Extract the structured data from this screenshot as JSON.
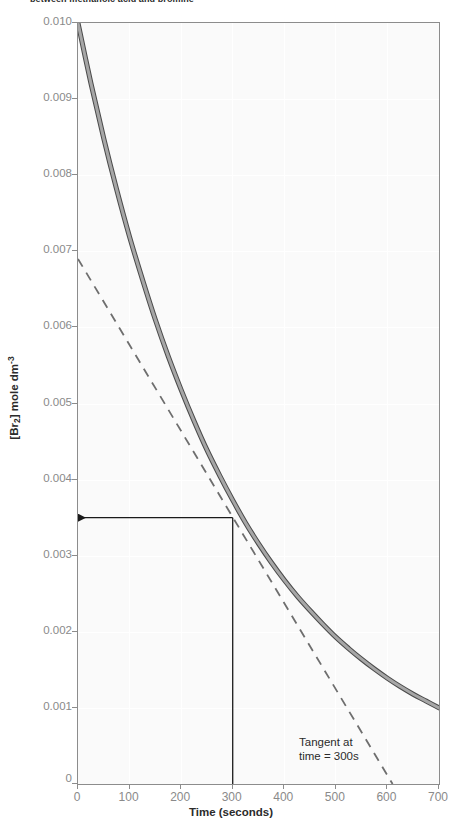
{
  "caption": {
    "text": "between methanoic acid and bromine"
  },
  "chart_data": {
    "type": "line",
    "title": "",
    "xlabel": "Time (seconds)",
    "ylabel": "[Br2] mole dm-3",
    "ylabel_display": "[Br",
    "ylabel_sub": "2",
    "ylabel_mid": "] mole dm",
    "ylabel_sup": "-3",
    "xlim": [
      0,
      700
    ],
    "ylim": [
      0,
      0.01
    ],
    "grid": true,
    "legend": "none",
    "xticks": [
      0,
      100,
      200,
      300,
      400,
      500,
      600,
      700
    ],
    "xticklabels": [
      "0",
      "100",
      "200",
      "300",
      "400",
      "500",
      "600",
      "700"
    ],
    "yticks": [
      0,
      0.001,
      0.002,
      0.003,
      0.004,
      0.005,
      0.006,
      0.007,
      0.008,
      0.009,
      0.01
    ],
    "yticklabels": [
      "0",
      "0.001",
      "0.002",
      "0.003",
      "0.004",
      "0.005",
      "0.006",
      "0.007",
      "0.008",
      "0.009",
      "0.010"
    ],
    "series": [
      {
        "name": "[Br2] decay curve",
        "style": "solid",
        "color": "#8c8c8c",
        "x": [
          0,
          25,
          50,
          75,
          100,
          125,
          150,
          175,
          200,
          225,
          250,
          275,
          300,
          325,
          350,
          375,
          400,
          425,
          450,
          475,
          500,
          525,
          550,
          575,
          600,
          625,
          650,
          675,
          700
        ],
        "y": [
          0.01,
          0.00921,
          0.00848,
          0.00781,
          0.00719,
          0.00663,
          0.0061,
          0.00562,
          0.00518,
          0.00477,
          0.00439,
          0.00405,
          0.00373,
          0.00343,
          0.00316,
          0.00291,
          0.00268,
          0.00247,
          0.00228,
          0.0021,
          0.00193,
          0.00178,
          0.00164,
          0.00151,
          0.00139,
          0.00128,
          0.00118,
          0.00109,
          0.001
        ]
      },
      {
        "name": "Tangent at time = 300s",
        "style": "dashed",
        "color": "#8c8c8c",
        "x": [
          0,
          610
        ],
        "y": [
          0.0069,
          0.0
        ]
      }
    ],
    "annotations": [
      {
        "name": "tangent-label",
        "line1": "Tangent at",
        "line2": "time = 300s",
        "x": 585,
        "y": 0.00068
      }
    ],
    "construction_lines": [
      {
        "name": "vertical-dropline-at-300s",
        "from": [
          300,
          0.0035
        ],
        "to": [
          300,
          0.0
        ]
      },
      {
        "name": "horizontal-arrow-to-yaxis",
        "from": [
          300,
          0.0035
        ],
        "to": [
          0,
          0.0035
        ],
        "arrowhead": "left"
      }
    ],
    "colors": {
      "curve": "#8c8c8c",
      "curve_edge": "#4a4a4a",
      "axis": "#8c8c8c",
      "tick_text": "#8a8a8a",
      "label_text": "#2b2b2b",
      "panel_bg": "#fafafa",
      "gridline": "#ffffff",
      "construction": "#1a1a1a"
    }
  }
}
